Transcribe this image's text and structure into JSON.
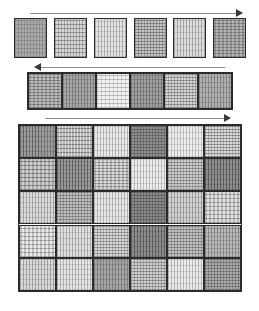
{
  "figure": {
    "background_color": "#ffffff",
    "width": 259,
    "height": 311,
    "caption": "",
    "patch_border_color": "#2b2b2b",
    "arrow_color": "#8c8c8c",
    "arrow_head_color": "#3a3a3a"
  },
  "panels": [
    {
      "id": "top-row",
      "name": "separated-patch-row",
      "layout": "spaced-row",
      "arrow": {
        "direction": "right",
        "label": ""
      },
      "x": 14,
      "y": 18,
      "width": 232,
      "height": 40,
      "arrow_x": 30,
      "arrow_y": 9,
      "arrow_width": 212,
      "columns": 6,
      "rows": 1,
      "gap": 7,
      "patches": [
        {
          "orientation": "vertical",
          "base": "#a8a8a8",
          "stripe": "#8f8f8f",
          "period": 3,
          "density": 0.62,
          "cross": 0.25,
          "cross_period": 4
        },
        {
          "orientation": "horizontal",
          "base": "#d6d6d6",
          "stripe": "#9a9a9a",
          "period": 4,
          "density": 0.45,
          "cross": 0.55,
          "cross_period": 3
        },
        {
          "orientation": "vertical",
          "base": "#e2e2e2",
          "stripe": "#b0b0b0",
          "period": 3,
          "density": 0.4,
          "cross": 0.2,
          "cross_period": 5
        },
        {
          "orientation": "horizontal",
          "base": "#c2c2c2",
          "stripe": "#8a8a8a",
          "period": 3,
          "density": 0.58,
          "cross": 0.5,
          "cross_period": 3
        },
        {
          "orientation": "vertical",
          "base": "#dcdcdc",
          "stripe": "#a6a6a6",
          "period": 3,
          "density": 0.42,
          "cross": 0.18,
          "cross_period": 6
        },
        {
          "orientation": "horizontal",
          "base": "#b5b5b5",
          "stripe": "#8c8c8c",
          "period": 3,
          "density": 0.6,
          "cross": 0.45,
          "cross_period": 4
        }
      ]
    },
    {
      "id": "middle-row",
      "name": "adjacent-patch-row",
      "layout": "contiguous-row",
      "arrow": {
        "direction": "left",
        "label": ""
      },
      "x": 27,
      "y": 72,
      "width": 206,
      "height": 38,
      "arrow_x": 35,
      "arrow_y": 63,
      "arrow_width": 190,
      "columns": 6,
      "rows": 1,
      "gap": 0,
      "patches": [
        {
          "orientation": "horizontal",
          "base": "#bdbdbd",
          "stripe": "#8a8a8a",
          "period": 3,
          "density": 0.58,
          "cross": 0.42,
          "cross_period": 4
        },
        {
          "orientation": "vertical",
          "base": "#a6a6a6",
          "stripe": "#7f7f7f",
          "period": 3,
          "density": 0.66,
          "cross": 0.22,
          "cross_period": 4
        },
        {
          "orientation": "horizontal",
          "base": "#f0f0f0",
          "stripe": "#bdbdbd",
          "period": 4,
          "density": 0.32,
          "cross": 0.28,
          "cross_period": 4
        },
        {
          "orientation": "vertical",
          "base": "#9e9e9e",
          "stripe": "#7a7a7a",
          "period": 3,
          "density": 0.68,
          "cross": 0.3,
          "cross_period": 4
        },
        {
          "orientation": "horizontal",
          "base": "#d2d2d2",
          "stripe": "#979797",
          "period": 3,
          "density": 0.5,
          "cross": 0.48,
          "cross_period": 3
        },
        {
          "orientation": "vertical",
          "base": "#b0b0b0",
          "stripe": "#858585",
          "period": 3,
          "density": 0.62,
          "cross": 0.26,
          "cross_period": 5
        }
      ]
    },
    {
      "id": "bottom-grid",
      "name": "patch-grid",
      "layout": "grid",
      "arrow": {
        "direction": "right",
        "label": ""
      },
      "x": 18,
      "y": 124,
      "width": 224,
      "height": 168,
      "arrow_x": 45,
      "arrow_y": 114,
      "arrow_width": 185,
      "columns": 6,
      "rows": 5,
      "gap": 0,
      "patches": [
        {
          "orientation": "vertical",
          "base": "#9b9b9b",
          "stripe": "#767676",
          "period": 3,
          "density": 0.68,
          "cross": 0.24,
          "cross_period": 5
        },
        {
          "orientation": "horizontal",
          "base": "#e4e4e4",
          "stripe": "#9f9f9f",
          "period": 4,
          "density": 0.44,
          "cross": 0.56,
          "cross_period": 3
        },
        {
          "orientation": "vertical",
          "base": "#e8e8e8",
          "stripe": "#b4b4b4",
          "period": 3,
          "density": 0.38,
          "cross": 0.18,
          "cross_period": 6
        },
        {
          "orientation": "horizontal",
          "base": "#8f8f8f",
          "stripe": "#6e6e6e",
          "period": 3,
          "density": 0.66,
          "cross": 0.52,
          "cross_period": 3
        },
        {
          "orientation": "vertical",
          "base": "#ededed",
          "stripe": "#bdbdbd",
          "period": 3,
          "density": 0.34,
          "cross": 0.16,
          "cross_period": 6
        },
        {
          "orientation": "horizontal",
          "base": "#d9d9d9",
          "stripe": "#949494",
          "period": 3,
          "density": 0.52,
          "cross": 0.5,
          "cross_period": 3
        },
        {
          "orientation": "horizontal",
          "base": "#cfcfcf",
          "stripe": "#909090",
          "period": 4,
          "density": 0.5,
          "cross": 0.46,
          "cross_period": 4
        },
        {
          "orientation": "vertical",
          "base": "#9a9a9a",
          "stripe": "#757575",
          "period": 3,
          "density": 0.7,
          "cross": 0.26,
          "cross_period": 4
        },
        {
          "orientation": "horizontal",
          "base": "#dcdcdc",
          "stripe": "#a0a0a0",
          "period": 3,
          "density": 0.48,
          "cross": 0.44,
          "cross_period": 4
        },
        {
          "orientation": "vertical",
          "base": "#ececec",
          "stripe": "#b8b8b8",
          "period": 3,
          "density": 0.36,
          "cross": 0.18,
          "cross_period": 6
        },
        {
          "orientation": "horizontal",
          "base": "#cacaca",
          "stripe": "#929292",
          "period": 3,
          "density": 0.54,
          "cross": 0.48,
          "cross_period": 3
        },
        {
          "orientation": "vertical",
          "base": "#8d8d8d",
          "stripe": "#6b6b6b",
          "period": 3,
          "density": 0.72,
          "cross": 0.22,
          "cross_period": 5
        },
        {
          "orientation": "vertical",
          "base": "#dadada",
          "stripe": "#a4a4a4",
          "period": 3,
          "density": 0.44,
          "cross": 0.2,
          "cross_period": 5
        },
        {
          "orientation": "horizontal",
          "base": "#bdbdbd",
          "stripe": "#8b8b8b",
          "period": 3,
          "density": 0.56,
          "cross": 0.5,
          "cross_period": 3
        },
        {
          "orientation": "vertical",
          "base": "#e6e6e6",
          "stripe": "#b2b2b2",
          "period": 3,
          "density": 0.38,
          "cross": 0.18,
          "cross_period": 6
        },
        {
          "orientation": "horizontal",
          "base": "#8a8a8a",
          "stripe": "#6a6a6a",
          "period": 3,
          "density": 0.68,
          "cross": 0.54,
          "cross_period": 3
        },
        {
          "orientation": "vertical",
          "base": "#d0d0d0",
          "stripe": "#9c9c9c",
          "period": 3,
          "density": 0.46,
          "cross": 0.2,
          "cross_period": 5
        },
        {
          "orientation": "horizontal",
          "base": "#e2e2e2",
          "stripe": "#a8a8a8",
          "period": 4,
          "density": 0.42,
          "cross": 0.46,
          "cross_period": 4
        },
        {
          "orientation": "horizontal",
          "base": "#e9e9e9",
          "stripe": "#b0b0b0",
          "period": 4,
          "density": 0.4,
          "cross": 0.44,
          "cross_period": 4
        },
        {
          "orientation": "vertical",
          "base": "#dedede",
          "stripe": "#aaaaaa",
          "period": 3,
          "density": 0.42,
          "cross": 0.18,
          "cross_period": 6
        },
        {
          "orientation": "horizontal",
          "base": "#d4d4d4",
          "stripe": "#9a9a9a",
          "period": 3,
          "density": 0.5,
          "cross": 0.48,
          "cross_period": 3
        },
        {
          "orientation": "vertical",
          "base": "#8c8c8c",
          "stripe": "#6c6c6c",
          "period": 3,
          "density": 0.72,
          "cross": 0.24,
          "cross_period": 5
        },
        {
          "orientation": "horizontal",
          "base": "#c0c0c0",
          "stripe": "#8d8d8d",
          "period": 3,
          "density": 0.56,
          "cross": 0.5,
          "cross_period": 3
        },
        {
          "orientation": "vertical",
          "base": "#b8b8b8",
          "stripe": "#8a8a8a",
          "period": 3,
          "density": 0.58,
          "cross": 0.26,
          "cross_period": 4
        },
        {
          "orientation": "vertical",
          "base": "#d8d8d8",
          "stripe": "#a2a2a2",
          "period": 3,
          "density": 0.44,
          "cross": 0.2,
          "cross_period": 5
        },
        {
          "orientation": "vertical",
          "base": "#e4e4e4",
          "stripe": "#b0b0b0",
          "period": 3,
          "density": 0.38,
          "cross": 0.2,
          "cross_period": 5
        },
        {
          "orientation": "vertical",
          "base": "#a4a4a4",
          "stripe": "#7e7e7e",
          "period": 3,
          "density": 0.66,
          "cross": 0.24,
          "cross_period": 5
        },
        {
          "orientation": "horizontal",
          "base": "#cdcdcd",
          "stripe": "#959595",
          "period": 3,
          "density": 0.52,
          "cross": 0.5,
          "cross_period": 3
        },
        {
          "orientation": "vertical",
          "base": "#eaeaea",
          "stripe": "#b6b6b6",
          "period": 3,
          "density": 0.36,
          "cross": 0.18,
          "cross_period": 6
        },
        {
          "orientation": "horizontal",
          "base": "#a8a8a8",
          "stripe": "#7f7f7f",
          "period": 3,
          "density": 0.62,
          "cross": 0.52,
          "cross_period": 3
        }
      ]
    }
  ]
}
